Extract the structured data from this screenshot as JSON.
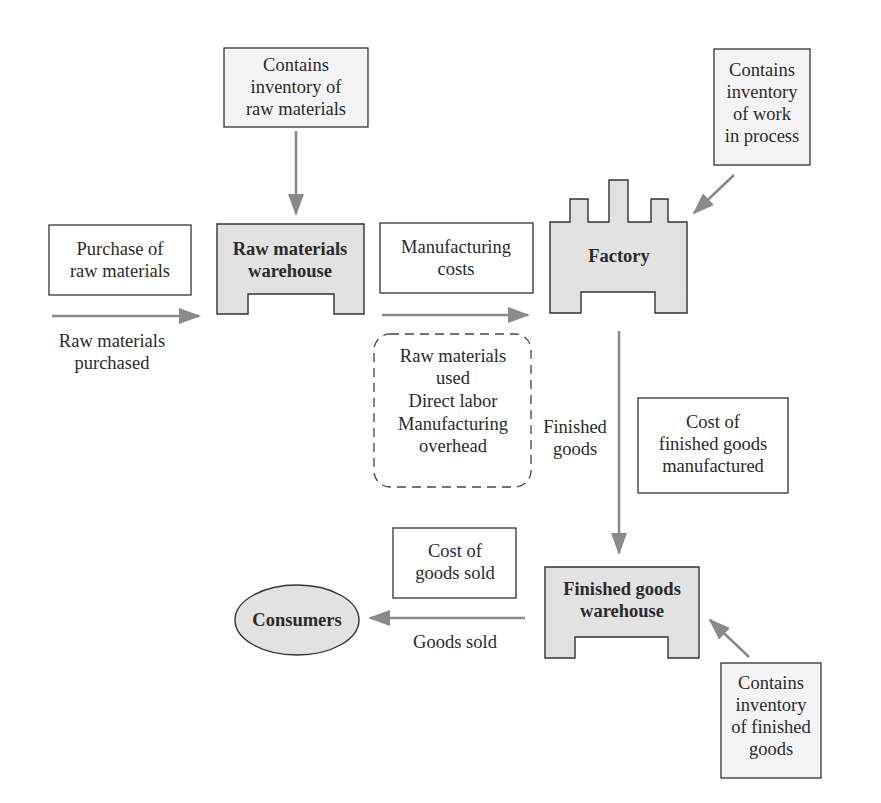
{
  "diagram": {
    "type": "manufacturing-flow",
    "colors": {
      "shape_fill": "#e2e2e2",
      "note_fill": "#f4f4f4",
      "stroke": "#333333",
      "arrow": "#8a8a8a",
      "background": "#ffffff"
    },
    "nodes": {
      "raw_materials_warehouse": {
        "lines": [
          "Raw materials",
          "warehouse"
        ]
      },
      "factory": {
        "lines": [
          "Factory"
        ]
      },
      "finished_goods_warehouse": {
        "lines": [
          "Finished goods",
          "warehouse"
        ]
      },
      "consumers": {
        "lines": [
          "Consumers"
        ]
      }
    },
    "notes": {
      "inventory_raw": {
        "lines": [
          "Contains",
          "inventory of",
          "raw materials"
        ]
      },
      "inventory_wip": {
        "lines": [
          "Contains",
          "inventory",
          "of work",
          "in process"
        ]
      },
      "inventory_finished": {
        "lines": [
          "Contains",
          "inventory",
          "of finished",
          "goods"
        ]
      },
      "purchase_of_raw": {
        "lines": [
          "Purchase of",
          "raw materials"
        ]
      },
      "manufacturing_costs": {
        "lines": [
          "Manufacturing",
          "costs"
        ]
      },
      "cost_finished_manufactured": {
        "lines": [
          "Cost of",
          "finished goods",
          "manufactured"
        ]
      },
      "cost_goods_sold": {
        "lines": [
          "Cost of",
          "goods sold"
        ]
      },
      "cost_components": {
        "lines": [
          "Raw materials",
          "used",
          "Direct labor",
          "Manufacturing",
          "overhead"
        ]
      }
    },
    "flow_labels": {
      "raw_materials_purchased": {
        "lines": [
          "Raw materials",
          "purchased"
        ]
      },
      "finished_goods": {
        "lines": [
          "Finished",
          "goods"
        ]
      },
      "goods_sold": {
        "lines": [
          "Goods sold"
        ]
      }
    }
  }
}
